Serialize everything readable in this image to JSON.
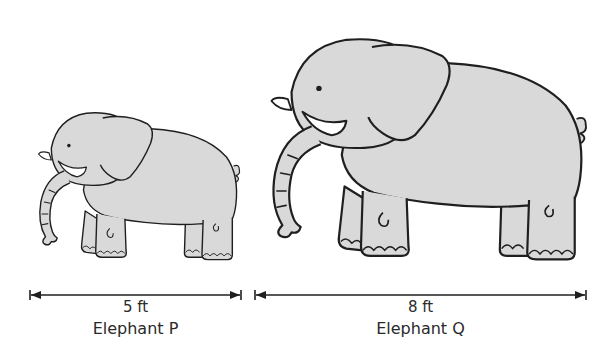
{
  "colors": {
    "background": "#ffffff",
    "elephant_fill": "#d9d9d9",
    "outline": "#1f1f1f",
    "tusk_fill": "#ffffff",
    "text": "#2a2a2a"
  },
  "elephants": [
    {
      "id": "P",
      "name": "Elephant P",
      "height_label": "5 ft",
      "height_value": 5,
      "unit": "ft",
      "size": "small"
    },
    {
      "id": "Q",
      "name": "Elephant Q",
      "height_label": "8 ft",
      "height_value": 8,
      "unit": "ft",
      "size": "large"
    }
  ],
  "icons": {
    "elephant": "elephant-illustration",
    "arrow": "double-headed-dimension-arrow"
  }
}
